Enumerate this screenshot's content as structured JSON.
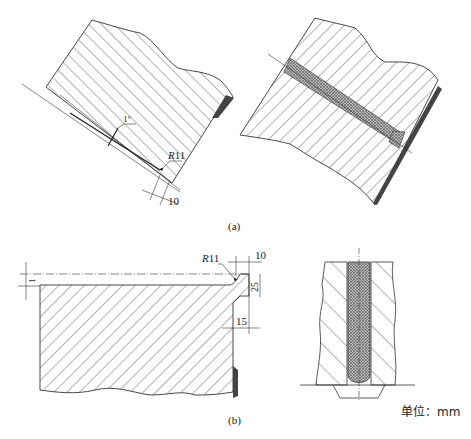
{
  "figure": {
    "panel_a": {
      "caption": "(a)",
      "left_view": {
        "angle_label": "1°",
        "radius_prefix": "R",
        "radius_value": "11",
        "width_label": "10"
      },
      "right_view": {}
    },
    "panel_b": {
      "caption": "(b)",
      "left_view": {
        "offset_label": "1",
        "radius_prefix": "R",
        "radius_value": "11",
        "top_width_label": "10",
        "height_label": "25",
        "bottom_width_label": "15"
      },
      "right_view": {}
    },
    "unit_label": "单位：mm"
  },
  "colors": {
    "line": "#333333",
    "weld_dark": "#444444",
    "filler_gray": "#9a9a9a"
  }
}
